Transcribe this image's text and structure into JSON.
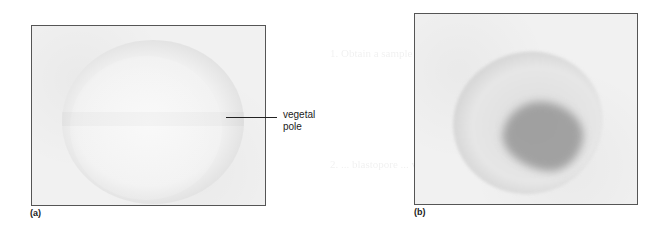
{
  "figure": {
    "panels": [
      {
        "id": "a",
        "letter": "(a)",
        "description": "pale spherical egg with lighter center and gray outer rim",
        "annotation": {
          "label_line1": "vegetal",
          "label_line2": "pole"
        }
      },
      {
        "id": "b",
        "letter": "(b)",
        "description": "egg with dark stained region on right side and darker rim"
      }
    ]
  },
  "background_bleed_text": [
    "Contribution to Classics",
    "1. Obtain a sample of eggs ... staining ... embryos ... examine",
    "2. ... blastopore ... vegetal ... primitive ..."
  ],
  "colors": {
    "frame": "#555555",
    "panel_bg": "#f1f1f1",
    "stain_dark": "#8c8c8c",
    "label_text": "#222222"
  }
}
